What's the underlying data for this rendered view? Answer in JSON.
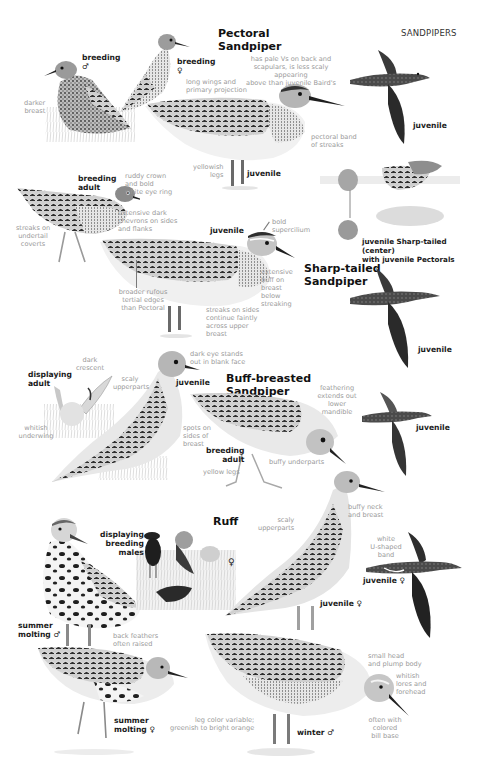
{
  "header": {
    "section": "SANDPIPERS"
  },
  "colors": {
    "text_dark": "#1a1a1a",
    "text_annotation": "#9a9a9a",
    "bird_dark": "#2b2b2b",
    "bird_mid": "#8a8a8a",
    "bird_light": "#d8d8d8",
    "background": "#ffffff"
  },
  "species": [
    {
      "name": "Pectoral\nSandpiper",
      "figures": [
        {
          "tag": "breeding\n♂",
          "notes": [
            "darker\nbreast"
          ]
        },
        {
          "tag": "breeding\n♀",
          "notes": [
            "long wings and\nprimary projection"
          ]
        },
        {
          "tag": "juvenile",
          "notes": [
            "has pale Vs on back and\nscapulars, is less scaly appearing\nabove than juvenile Baird's",
            "pectoral band\nof streaks",
            "yellowish\nlegs"
          ]
        },
        {
          "tag": "juvenile",
          "notes": [],
          "pose": "flight"
        }
      ]
    },
    {
      "name": "Sharp-tailed\nSandpiper",
      "figures": [
        {
          "tag": "breeding\nadult",
          "notes": [
            "ruddy crown\nand bold\nwhite eye ring",
            "extensive dark\nchevrons on sides\nand flanks",
            "streaks on\nundertail\ncoverts"
          ]
        },
        {
          "tag": "juvenile",
          "notes": [
            "bold\nsupercilium",
            "extensive\nbuff on\nbreast\nbelow\nstreaking",
            "broader rufous\ntertial edges\nthan Pectoral",
            "streaks on sides\ncontinue faintly\nacross upper\nbreast"
          ]
        },
        {
          "tag": "juvenile Sharp-tailed (center)\nwith juvenile Pectorals",
          "notes": [],
          "pose": "group"
        },
        {
          "tag": "juvenile",
          "notes": [],
          "pose": "flight"
        }
      ]
    },
    {
      "name": "Buff-breasted\nSandpiper",
      "figures": [
        {
          "tag": "displaying\nadult",
          "notes": [
            "dark\ncrescent",
            "whitish\nunderwing"
          ]
        },
        {
          "tag": "juvenile",
          "notes": [
            "dark eye stands\nout in blank face",
            "scaly\nupperparts",
            "spots on\nsides of\nbreast"
          ]
        },
        {
          "tag": "breeding\nadult",
          "notes": [
            "yellow legs",
            "buffy underparts",
            "feathering\nextends out\nlower\nmandible"
          ]
        },
        {
          "tag": "juvenile",
          "notes": [],
          "pose": "flight"
        }
      ]
    },
    {
      "name": "Ruff",
      "figures": [
        {
          "tag": "summer\nmolting ♂",
          "notes": []
        },
        {
          "tag": "displaying\nbreeding\nmales",
          "notes": [
            "back feathers\noften raised"
          ],
          "female_symbol": "♀"
        },
        {
          "tag": "juvenile ♀",
          "notes": [
            "scaly\nupperparts",
            "buffy neck\nand breast"
          ]
        },
        {
          "tag": "juvenile ♀",
          "notes": [
            "white\nU-shaped\nband"
          ],
          "pose": "flight"
        },
        {
          "tag": "summer\nmolting ♀",
          "notes": []
        },
        {
          "tag": "winter ♂",
          "notes": [
            "small head\nand plump body",
            "whitish\nlores and\nforehead",
            "often with\ncolored\nbill base",
            "leg color variable;\ngreenish to bright orange"
          ]
        }
      ]
    }
  ]
}
